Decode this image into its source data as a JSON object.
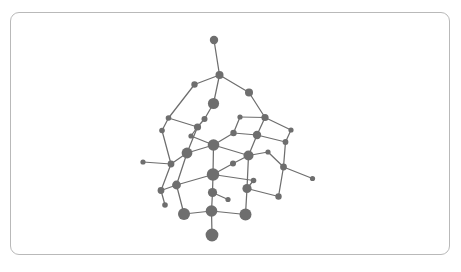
{
  "viewer": {
    "width": 461,
    "height": 272,
    "background_color": "#ffffff",
    "frame": {
      "name": "canvas-frame",
      "x": 10,
      "y": 12,
      "width": 440,
      "height": 243,
      "border_color": "#b9b9b9",
      "corner_radius": 9
    }
  },
  "structure": {
    "title": "",
    "atom_color": "#6e6e6e",
    "bond_color": "#6e6e6e",
    "bond_width": 1.25,
    "atom_count": 38,
    "bond_count": 52,
    "atoms": [
      {
        "id": "a0",
        "label": "",
        "x": 214.0,
        "y": 40.0,
        "r": 4.2
      },
      {
        "id": "a1",
        "label": "",
        "x": 219.5,
        "y": 75.0,
        "r": 4.0
      },
      {
        "id": "a2",
        "label": "",
        "x": 194.5,
        "y": 84.5,
        "r": 3.2
      },
      {
        "id": "a3",
        "label": "",
        "x": 249.0,
        "y": 92.5,
        "r": 4.0
      },
      {
        "id": "a4",
        "label": "",
        "x": 213.5,
        "y": 103.5,
        "r": 5.6
      },
      {
        "id": "a5",
        "label": "",
        "x": 197.5,
        "y": 127.0,
        "r": 3.6
      },
      {
        "id": "a6",
        "label": "",
        "x": 257.0,
        "y": 135.0,
        "r": 4.2
      },
      {
        "id": "a7",
        "label": "",
        "x": 162.0,
        "y": 130.5,
        "r": 2.8
      },
      {
        "id": "a8",
        "label": "",
        "x": 233.5,
        "y": 133.0,
        "r": 3.2
      },
      {
        "id": "a9",
        "label": "",
        "x": 285.5,
        "y": 142.0,
        "r": 2.9
      },
      {
        "id": "a10",
        "label": "",
        "x": 213.5,
        "y": 145.0,
        "r": 5.8
      },
      {
        "id": "a11",
        "label": "",
        "x": 187.0,
        "y": 153.0,
        "r": 5.4
      },
      {
        "id": "a12",
        "label": "",
        "x": 248.5,
        "y": 155.5,
        "r": 5.0
      },
      {
        "id": "a13",
        "label": "",
        "x": 143.0,
        "y": 162.0,
        "r": 2.6
      },
      {
        "id": "a14",
        "label": "",
        "x": 171.0,
        "y": 164.0,
        "r": 3.4
      },
      {
        "id": "a15",
        "label": "",
        "x": 233.0,
        "y": 163.5,
        "r": 3.0
      },
      {
        "id": "a16",
        "label": "",
        "x": 213.0,
        "y": 174.5,
        "r": 6.2
      },
      {
        "id": "a17",
        "label": "",
        "x": 283.5,
        "y": 167.0,
        "r": 3.4
      },
      {
        "id": "a18",
        "label": "",
        "x": 312.5,
        "y": 178.5,
        "r": 2.6
      },
      {
        "id": "a19",
        "label": "",
        "x": 253.5,
        "y": 180.5,
        "r": 2.8
      },
      {
        "id": "a20",
        "label": "",
        "x": 176.5,
        "y": 185.0,
        "r": 4.4
      },
      {
        "id": "a21",
        "label": "",
        "x": 161.0,
        "y": 190.5,
        "r": 3.4
      },
      {
        "id": "a22",
        "label": "",
        "x": 247.0,
        "y": 188.5,
        "r": 4.6
      },
      {
        "id": "a23",
        "label": "",
        "x": 212.5,
        "y": 192.5,
        "r": 4.6
      },
      {
        "id": "a24",
        "label": "",
        "x": 278.5,
        "y": 196.5,
        "r": 3.2
      },
      {
        "id": "a25",
        "label": "",
        "x": 211.5,
        "y": 211.0,
        "r": 5.8
      },
      {
        "id": "a26",
        "label": "",
        "x": 184.0,
        "y": 214.0,
        "r": 6.0
      },
      {
        "id": "a27",
        "label": "",
        "x": 245.5,
        "y": 214.5,
        "r": 6.0
      },
      {
        "id": "a28",
        "label": "",
        "x": 212.0,
        "y": 235.0,
        "r": 6.4
      },
      {
        "id": "a29",
        "label": "",
        "x": 204.5,
        "y": 119.0,
        "r": 3.0
      },
      {
        "id": "a30",
        "label": "",
        "x": 265.0,
        "y": 117.5,
        "r": 3.6
      },
      {
        "id": "a31",
        "label": "",
        "x": 168.5,
        "y": 118.0,
        "r": 2.8
      },
      {
        "id": "a32",
        "label": "",
        "x": 291.0,
        "y": 130.0,
        "r": 2.6
      },
      {
        "id": "a33",
        "label": "",
        "x": 165.0,
        "y": 205.0,
        "r": 2.8
      },
      {
        "id": "a34",
        "label": "",
        "x": 268.0,
        "y": 152.0,
        "r": 2.6
      },
      {
        "id": "a35",
        "label": "",
        "x": 191.0,
        "y": 136.0,
        "r": 2.6
      },
      {
        "id": "a36",
        "label": "",
        "x": 240.0,
        "y": 117.0,
        "r": 2.6
      },
      {
        "id": "a37",
        "label": "",
        "x": 228.0,
        "y": 199.5,
        "r": 2.6
      }
    ],
    "bonds": [
      {
        "from": "a0",
        "to": "a1"
      },
      {
        "from": "a1",
        "to": "a2"
      },
      {
        "from": "a1",
        "to": "a3"
      },
      {
        "from": "a1",
        "to": "a4"
      },
      {
        "from": "a2",
        "to": "a31"
      },
      {
        "from": "a3",
        "to": "a30"
      },
      {
        "from": "a4",
        "to": "a29"
      },
      {
        "from": "a29",
        "to": "a5"
      },
      {
        "from": "a5",
        "to": "a31"
      },
      {
        "from": "a5",
        "to": "a35"
      },
      {
        "from": "a31",
        "to": "a7"
      },
      {
        "from": "a30",
        "to": "a6"
      },
      {
        "from": "a30",
        "to": "a32"
      },
      {
        "from": "a36",
        "to": "a30"
      },
      {
        "from": "a36",
        "to": "a8"
      },
      {
        "from": "a8",
        "to": "a10"
      },
      {
        "from": "a6",
        "to": "a8"
      },
      {
        "from": "a6",
        "to": "a9"
      },
      {
        "from": "a9",
        "to": "a32"
      },
      {
        "from": "a9",
        "to": "a17"
      },
      {
        "from": "a7",
        "to": "a14"
      },
      {
        "from": "a35",
        "to": "a10"
      },
      {
        "from": "a5",
        "to": "a11"
      },
      {
        "from": "a10",
        "to": "a11"
      },
      {
        "from": "a10",
        "to": "a12"
      },
      {
        "from": "a10",
        "to": "a16"
      },
      {
        "from": "a12",
        "to": "a6"
      },
      {
        "from": "a12",
        "to": "a34"
      },
      {
        "from": "a34",
        "to": "a17"
      },
      {
        "from": "a11",
        "to": "a14"
      },
      {
        "from": "a11",
        "to": "a20"
      },
      {
        "from": "a13",
        "to": "a14"
      },
      {
        "from": "a14",
        "to": "a21"
      },
      {
        "from": "a15",
        "to": "a16"
      },
      {
        "from": "a15",
        "to": "a12"
      },
      {
        "from": "a16",
        "to": "a19"
      },
      {
        "from": "a16",
        "to": "a20"
      },
      {
        "from": "a16",
        "to": "a23"
      },
      {
        "from": "a19",
        "to": "a22"
      },
      {
        "from": "a17",
        "to": "a18"
      },
      {
        "from": "a17",
        "to": "a24"
      },
      {
        "from": "a12",
        "to": "a22"
      },
      {
        "from": "a20",
        "to": "a21"
      },
      {
        "from": "a20",
        "to": "a26"
      },
      {
        "from": "a21",
        "to": "a33"
      },
      {
        "from": "a22",
        "to": "a24"
      },
      {
        "from": "a22",
        "to": "a27"
      },
      {
        "from": "a23",
        "to": "a25"
      },
      {
        "from": "a37",
        "to": "a23"
      },
      {
        "from": "a25",
        "to": "a26"
      },
      {
        "from": "a25",
        "to": "a27"
      },
      {
        "from": "a25",
        "to": "a28"
      }
    ]
  }
}
